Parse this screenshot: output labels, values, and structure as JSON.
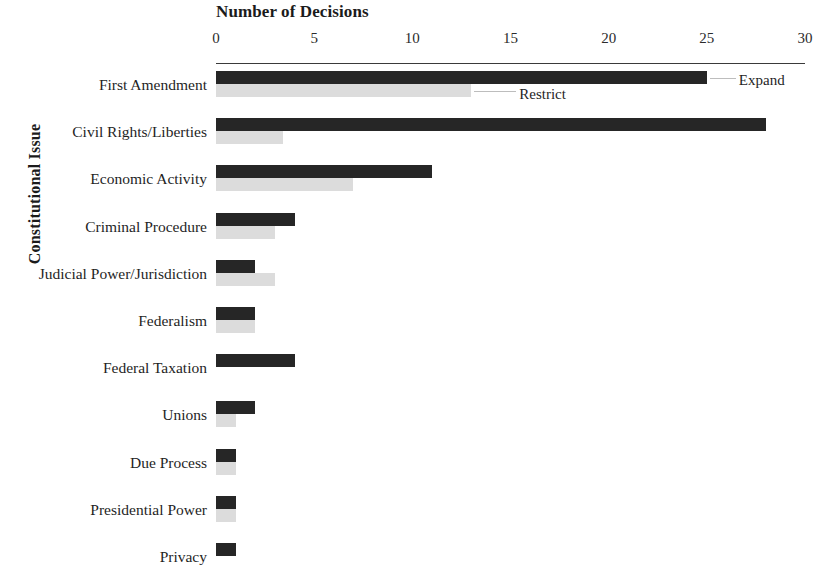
{
  "chart_data": {
    "type": "bar",
    "orientation": "horizontal",
    "title": "",
    "xlabel": "Number of Decisions",
    "ylabel": "Constitutional Issue",
    "xlim": [
      0,
      30
    ],
    "xticks": [
      0,
      5,
      10,
      15,
      20,
      25,
      30
    ],
    "xtick_labels": [
      "0",
      "5",
      "10",
      "15",
      "20",
      "25",
      "30"
    ],
    "grid": false,
    "legend_position": "inline-callout",
    "categories": [
      "First Amendment",
      "Civil Rights/Liberties",
      "Economic Activity",
      "Criminal Procedure",
      "Judicial Power/Jurisdiction",
      "Federalism",
      "Federal Taxation",
      "Unions",
      "Due Process",
      "Presidential Power",
      "Privacy"
    ],
    "series": [
      {
        "name": "Expand",
        "color": "#262626",
        "values": [
          25,
          28,
          11,
          4,
          2,
          2,
          4,
          2,
          1,
          1,
          1
        ]
      },
      {
        "name": "Restrict",
        "color": "#dcdcdc",
        "values": [
          13,
          3.4,
          7,
          3,
          3,
          2,
          0,
          1,
          1,
          1,
          0
        ]
      }
    ],
    "annotations": [
      {
        "text": "Expand",
        "series": "Expand",
        "category": "First Amendment"
      },
      {
        "text": "Restrict",
        "series": "Restrict",
        "category": "First Amendment"
      }
    ]
  },
  "axes": {
    "x_title": "Number of Decisions",
    "y_title": "Constitutional Issue"
  },
  "callouts": {
    "expand": "Expand",
    "restrict": "Restrict"
  }
}
